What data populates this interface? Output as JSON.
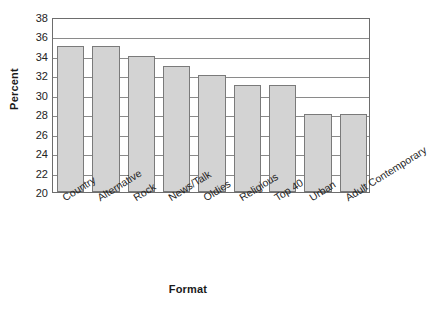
{
  "chart_data": {
    "type": "bar",
    "title": "",
    "xlabel": "Format",
    "ylabel": "Percent",
    "categories": [
      "Country",
      "Alternative",
      "Rock",
      "News/Talk",
      "Oldies",
      "Religious",
      "Top 40",
      "Urban",
      "Adult Contemporary"
    ],
    "values": [
      35,
      35,
      34,
      33,
      32,
      31,
      31,
      28,
      28
    ],
    "ylim": [
      20,
      38
    ],
    "ytick_step": 2,
    "yticks": [
      20,
      22,
      24,
      26,
      28,
      30,
      32,
      34,
      36,
      38
    ],
    "ytick_labels": [
      "20",
      "22",
      "24",
      "26",
      "28",
      "30",
      "32",
      "34",
      "36",
      "38"
    ],
    "grid": true,
    "grid_axis": "y",
    "legend": false,
    "legend_position": "none",
    "bar_color": "#d3d3d3",
    "bar_edge_color": "#7a7a7a",
    "axis_color": "#6d6d6d",
    "gridline_color": "#8a8a8a",
    "background_color": "#ffffff",
    "xtick_label_rotation": -32
  }
}
